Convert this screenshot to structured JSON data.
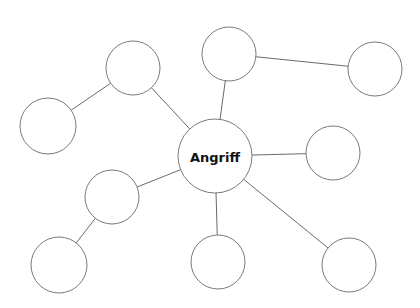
{
  "diagram": {
    "type": "mind-map",
    "center": {
      "id": "center",
      "label": "Angriff",
      "x": 215,
      "y": 156,
      "r": 37
    },
    "nodes": [
      {
        "id": "n-upper-left",
        "label": "",
        "x": 133,
        "y": 68,
        "r": 27
      },
      {
        "id": "n-left",
        "label": "",
        "x": 48,
        "y": 126,
        "r": 28
      },
      {
        "id": "n-top",
        "label": "",
        "x": 229,
        "y": 54,
        "r": 27
      },
      {
        "id": "n-top-right",
        "label": "",
        "x": 375,
        "y": 69,
        "r": 27
      },
      {
        "id": "n-right",
        "label": "",
        "x": 333,
        "y": 153,
        "r": 27
      },
      {
        "id": "n-mid-left",
        "label": "",
        "x": 112,
        "y": 197,
        "r": 27
      },
      {
        "id": "n-bottom-left",
        "label": "",
        "x": 59,
        "y": 265,
        "r": 28
      },
      {
        "id": "n-bottom-center",
        "label": "",
        "x": 218,
        "y": 262,
        "r": 27
      },
      {
        "id": "n-bottom-right",
        "label": "",
        "x": 349,
        "y": 265,
        "r": 27
      }
    ],
    "edges": [
      [
        "center",
        "n-upper-left"
      ],
      [
        "n-upper-left",
        "n-left"
      ],
      [
        "center",
        "n-top"
      ],
      [
        "n-top",
        "n-top-right"
      ],
      [
        "center",
        "n-right"
      ],
      [
        "center",
        "n-mid-left"
      ],
      [
        "n-mid-left",
        "n-bottom-left"
      ],
      [
        "center",
        "n-bottom-center"
      ],
      [
        "center",
        "n-bottom-right"
      ]
    ]
  }
}
